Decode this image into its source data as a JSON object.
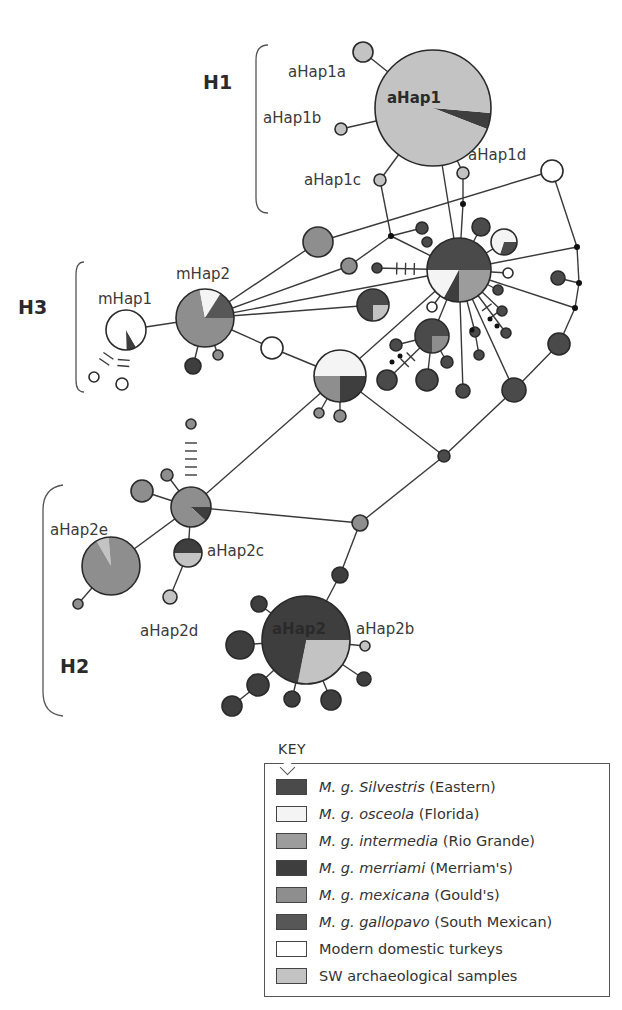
{
  "colors": {
    "silvestris": "#4a4a4a",
    "osceola": "#f4f4f4",
    "intermedia": "#9c9c9c",
    "merriami": "#3e3e3e",
    "mexicana": "#8e8e8e",
    "gallopavo": "#575757",
    "domestic": "#ffffff",
    "sw_arch": "#c3c3c3"
  },
  "groups": [
    {
      "id": "H1",
      "label": "H1",
      "x": 203,
      "y": 82
    },
    {
      "id": "H3",
      "label": "H3",
      "x": 18,
      "y": 307
    },
    {
      "id": "H2",
      "label": "H2",
      "x": 60,
      "y": 666
    }
  ],
  "haplotype_labels": [
    {
      "text": "aHap1",
      "x": 387,
      "y": 103,
      "bold": true
    },
    {
      "text": "aHap1a",
      "x": 288,
      "y": 77
    },
    {
      "text": "aHap1b",
      "x": 263,
      "y": 123
    },
    {
      "text": "aHap1c",
      "x": 304,
      "y": 185
    },
    {
      "text": "aHap1d",
      "x": 468,
      "y": 160
    },
    {
      "text": "mHap1",
      "x": 98,
      "y": 304
    },
    {
      "text": "mHap2",
      "x": 176,
      "y": 279
    },
    {
      "text": "aHap2e",
      "x": 50,
      "y": 535
    },
    {
      "text": "aHap2c",
      "x": 207,
      "y": 556
    },
    {
      "text": "aHap2d",
      "x": 140,
      "y": 636
    },
    {
      "text": "aHap2",
      "x": 272,
      "y": 634,
      "bold": true
    },
    {
      "text": "aHap2b",
      "x": 356,
      "y": 634
    }
  ],
  "key": {
    "title": "KEY",
    "items": [
      {
        "italic": "M. g. Silvestris",
        "plain": " (Eastern)",
        "color_key": "silvestris"
      },
      {
        "italic": "M. g. osceola",
        "plain": " (Florida)",
        "color_key": "osceola"
      },
      {
        "italic": "M. g. intermedia",
        "plain": " (Rio Grande)",
        "color_key": "intermedia"
      },
      {
        "italic": "M. g. merriami",
        "plain": " (Merriam's)",
        "color_key": "merriami"
      },
      {
        "italic": "M. g. mexicana",
        "plain": " (Gould's)",
        "color_key": "mexicana"
      },
      {
        "italic": "M. g. gallopavo",
        "plain": " (South Mexican)",
        "color_key": "gallopavo"
      },
      {
        "italic": "",
        "plain": "Modern domestic turkeys",
        "color_key": "domestic"
      },
      {
        "italic": "",
        "plain": "SW archaeological samples",
        "color_key": "sw_arch"
      }
    ]
  },
  "nodes": [
    {
      "id": "aHap1",
      "x": 433,
      "y": 108,
      "r": 58,
      "slices": [
        [
          "sw_arch",
          0.955
        ],
        [
          "merriami",
          0.045
        ]
      ],
      "start": 0
    },
    {
      "id": "aHap1a",
      "x": 363,
      "y": 52,
      "r": 10,
      "fill": "sw_arch"
    },
    {
      "id": "aHap1b",
      "x": 341,
      "y": 129,
      "r": 6,
      "fill": "sw_arch"
    },
    {
      "id": "aHap1c",
      "x": 380,
      "y": 180,
      "r": 6,
      "fill": "sw_arch"
    },
    {
      "id": "aHap1d",
      "x": 463,
      "y": 173,
      "r": 6,
      "fill": "sw_arch"
    },
    {
      "id": "dom1",
      "x": 552,
      "y": 171,
      "r": 11,
      "fill": "domestic"
    },
    {
      "id": "hubE",
      "x": 459,
      "y": 270,
      "r": 32,
      "slices": [
        [
          "silvestris",
          0.5
        ],
        [
          "intermedia",
          0.25
        ],
        [
          "merriami",
          0.08
        ],
        [
          "osceola",
          0.17
        ]
      ],
      "start": 0
    },
    {
      "id": "eSat1",
      "x": 481,
      "y": 227,
      "r": 9,
      "fill": "silvestris"
    },
    {
      "id": "eSat2",
      "x": 504,
      "y": 242,
      "r": 13,
      "slices": [
        [
          "osceola",
          0.6
        ],
        [
          "silvestris",
          0.3
        ],
        [
          "osceola",
          0.1
        ]
      ],
      "start": -90
    },
    {
      "id": "eSat3",
      "x": 422,
      "y": 228,
      "r": 6,
      "fill": "silvestris"
    },
    {
      "id": "eSat4",
      "x": 427,
      "y": 242,
      "r": 5,
      "fill": "silvestris"
    },
    {
      "id": "eSat5",
      "x": 377,
      "y": 268,
      "r": 5,
      "fill": "silvestris"
    },
    {
      "id": "eSat6",
      "x": 508,
      "y": 273,
      "r": 5,
      "fill": "domestic"
    },
    {
      "id": "eSat7",
      "x": 498,
      "y": 290,
      "r": 5,
      "fill": "silvestris"
    },
    {
      "id": "eSat8",
      "x": 502,
      "y": 311,
      "r": 5,
      "fill": "silvestris"
    },
    {
      "id": "eSat9",
      "x": 506,
      "y": 333,
      "r": 5,
      "fill": "silvestris"
    },
    {
      "id": "eSat10",
      "x": 432,
      "y": 307,
      "r": 5,
      "fill": "domestic"
    },
    {
      "id": "eSat11",
      "x": 475,
      "y": 332,
      "r": 5,
      "fill": "silvestris"
    },
    {
      "id": "eSat12",
      "x": 479,
      "y": 355,
      "r": 5,
      "fill": "silvestris"
    },
    {
      "id": "eSat13",
      "x": 463,
      "y": 391,
      "r": 7,
      "fill": "silvestris"
    },
    {
      "id": "eSat14",
      "x": 514,
      "y": 390,
      "r": 12,
      "fill": "silvestris"
    },
    {
      "id": "eSat15",
      "x": 558,
      "y": 278,
      "r": 7,
      "fill": "silvestris"
    },
    {
      "id": "eSat16",
      "x": 559,
      "y": 344,
      "r": 11,
      "fill": "silvestris"
    },
    {
      "id": "eSat17",
      "x": 373,
      "y": 305,
      "r": 16,
      "slices": [
        [
          "silvestris",
          0.75
        ],
        [
          "sw_arch",
          0.25
        ]
      ],
      "start": 0
    },
    {
      "id": "eSat18",
      "x": 432,
      "y": 336,
      "r": 17,
      "slices": [
        [
          "silvestris",
          0.75
        ],
        [
          "mexicana",
          0.25
        ]
      ],
      "start": 0
    },
    {
      "id": "eSat19",
      "x": 396,
      "y": 345,
      "r": 6,
      "fill": "silvestris"
    },
    {
      "id": "eSat20",
      "x": 447,
      "y": 362,
      "r": 6,
      "fill": "silvestris"
    },
    {
      "id": "eSat21",
      "x": 387,
      "y": 380,
      "r": 10,
      "fill": "silvestris"
    },
    {
      "id": "eSat22",
      "x": 427,
      "y": 380,
      "r": 11,
      "fill": "silvestris"
    },
    {
      "id": "midA",
      "x": 318,
      "y": 242,
      "r": 15,
      "fill": "mexicana"
    },
    {
      "id": "midB",
      "x": 349,
      "y": 266,
      "r": 8,
      "fill": "mexicana"
    },
    {
      "id": "mHap2",
      "x": 205,
      "y": 318,
      "r": 29,
      "slices": [
        [
          "mexicana",
          0.86
        ],
        [
          "osceola",
          0.0
        ],
        [
          "osceola",
          0.14
        ]
      ],
      "special": "mHap2"
    },
    {
      "id": "m2a",
      "x": 193,
      "y": 366,
      "r": 8,
      "fill": "merriami"
    },
    {
      "id": "m2b",
      "x": 218,
      "y": 355,
      "r": 5,
      "fill": "mexicana"
    },
    {
      "id": "mHap1",
      "x": 126,
      "y": 330,
      "r": 20,
      "slices": [
        [
          "domestic",
          0.92
        ],
        [
          "merriami",
          0.08
        ]
      ],
      "special": "mHap1"
    },
    {
      "id": "m1a",
      "x": 94,
      "y": 377,
      "r": 5,
      "fill": "domestic"
    },
    {
      "id": "m1b",
      "x": 122,
      "y": 384,
      "r": 6,
      "fill": "domestic"
    },
    {
      "id": "domMid",
      "x": 272,
      "y": 348,
      "r": 11,
      "fill": "domestic"
    },
    {
      "id": "hubMid",
      "x": 340,
      "y": 376,
      "r": 26,
      "slices": [
        [
          "osceola",
          0.5
        ],
        [
          "merriami",
          0.25
        ],
        [
          "mexicana",
          0.25
        ]
      ],
      "special": "hubMid"
    },
    {
      "id": "hm1",
      "x": 319,
      "y": 413,
      "r": 5,
      "fill": "mexicana"
    },
    {
      "id": "hm2",
      "x": 340,
      "y": 416,
      "r": 6,
      "fill": "mexicana"
    },
    {
      "id": "jn1",
      "x": 444,
      "y": 456,
      "r": 6,
      "fill": "silvestris"
    },
    {
      "id": "jn2",
      "x": 360,
      "y": 523,
      "r": 8,
      "fill": "mexicana"
    },
    {
      "id": "hubH2",
      "x": 191,
      "y": 507,
      "r": 20,
      "slices": [
        [
          "mexicana",
          0.9
        ],
        [
          "merriami",
          0.1
        ]
      ],
      "special": "hubH2"
    },
    {
      "id": "h2top",
      "x": 191,
      "y": 424,
      "r": 5,
      "fill": "mexicana"
    },
    {
      "id": "h2a",
      "x": 142,
      "y": 491,
      "r": 11,
      "fill": "mexicana"
    },
    {
      "id": "h2b",
      "x": 167,
      "y": 475,
      "r": 6,
      "fill": "mexicana"
    },
    {
      "id": "aHap2e",
      "x": 111,
      "y": 566,
      "r": 29,
      "slices": [
        [
          "mexicana",
          0.93
        ],
        [
          "sw_arch",
          0.07
        ]
      ],
      "special": "aHap2e"
    },
    {
      "id": "aHap2e_s",
      "x": 78,
      "y": 604,
      "r": 5,
      "fill": "mexicana"
    },
    {
      "id": "aHap2c",
      "x": 188,
      "y": 553,
      "r": 14,
      "slices": [
        [
          "merriami",
          0.5
        ],
        [
          "sw_arch",
          0.5
        ]
      ],
      "special": "aHap2c"
    },
    {
      "id": "aHap2d",
      "x": 170,
      "y": 597,
      "r": 7,
      "fill": "sw_arch"
    },
    {
      "id": "aHap2",
      "x": 306,
      "y": 640,
      "r": 44,
      "slices": [
        [
          "merriami",
          0.72
        ],
        [
          "sw_arch",
          0.28
        ]
      ],
      "special": "aHap2"
    },
    {
      "id": "a2up",
      "x": 340,
      "y": 575,
      "r": 8,
      "fill": "merriami"
    },
    {
      "id": "a2s1",
      "x": 259,
      "y": 604,
      "r": 8,
      "fill": "merriami"
    },
    {
      "id": "a2s2",
      "x": 240,
      "y": 645,
      "r": 14,
      "fill": "merriami"
    },
    {
      "id": "a2s3",
      "x": 258,
      "y": 685,
      "r": 11,
      "fill": "merriami"
    },
    {
      "id": "a2s4",
      "x": 232,
      "y": 706,
      "r": 10,
      "fill": "merriami"
    },
    {
      "id": "a2s5",
      "x": 292,
      "y": 699,
      "r": 8,
      "fill": "merriami"
    },
    {
      "id": "a2s6",
      "x": 331,
      "y": 700,
      "r": 10,
      "fill": "merriami"
    },
    {
      "id": "a2s7",
      "x": 364,
      "y": 679,
      "r": 7,
      "fill": "merriami"
    },
    {
      "id": "aHap2b",
      "x": 365,
      "y": 646,
      "r": 5,
      "fill": "sw_arch"
    }
  ],
  "edges": [
    [
      "aHap1",
      "aHap1a"
    ],
    [
      "aHap1",
      "aHap1b"
    ],
    [
      "aHap1",
      "aHap1c"
    ],
    [
      "aHap1",
      "aHap1d"
    ],
    [
      "aHap1c",
      "J1"
    ],
    [
      "aHap1d",
      "J2"
    ],
    [
      "aHap1",
      "hubE"
    ],
    [
      "J2",
      "hubE"
    ],
    [
      "J1",
      "hubE"
    ],
    [
      "J1",
      "midB"
    ],
    [
      "midA",
      "dom1"
    ],
    [
      "dom1",
      "J3"
    ],
    [
      "J3",
      "J4"
    ],
    [
      "J4",
      "J5"
    ],
    [
      "J5",
      "eSat16"
    ],
    [
      "hubE",
      "J3"
    ],
    [
      "hubE",
      "J5"
    ],
    [
      "J4",
      "eSat15"
    ],
    [
      "eSat16",
      "eSat14"
    ],
    [
      "eSat14",
      "jn1"
    ],
    [
      "mHap2",
      "midA"
    ],
    [
      "mHap2",
      "midB"
    ],
    [
      "mHap2",
      "hubE"
    ],
    [
      "mHap2",
      "eSat17"
    ],
    [
      "mHap2",
      "mHap1"
    ],
    [
      "mHap2",
      "domMid"
    ],
    [
      "domMid",
      "hubMid"
    ],
    [
      "mHap2",
      "m2a"
    ],
    [
      "mHap2",
      "m2b"
    ],
    [
      "hubMid",
      "hubE"
    ],
    [
      "hubMid",
      "hm1"
    ],
    [
      "hubMid",
      "hm2"
    ],
    [
      "hubMid",
      "jn1"
    ],
    [
      "hubMid",
      "hubH2"
    ],
    [
      "jn1",
      "jn2"
    ],
    [
      "jn2",
      "hubH2"
    ],
    [
      "jn2",
      "a2up"
    ],
    [
      "a2up",
      "aHap2"
    ],
    [
      "hubH2",
      "h2a"
    ],
    [
      "hubH2",
      "h2b"
    ],
    [
      "hubH2",
      "aHap2e"
    ],
    [
      "hubH2",
      "aHap2c"
    ],
    [
      "aHap2c",
      "aHap2d"
    ],
    [
      "aHap2e",
      "aHap2e_s"
    ],
    [
      "aHap2",
      "a2s1"
    ],
    [
      "aHap2",
      "a2s2"
    ],
    [
      "aHap2",
      "a2s3"
    ],
    [
      "a2s3",
      "a2s4"
    ],
    [
      "aHap2",
      "a2s5"
    ],
    [
      "aHap2",
      "a2s6"
    ],
    [
      "aHap2",
      "a2s7"
    ],
    [
      "aHap2",
      "aHap2b"
    ],
    [
      "hubE",
      "eSat1"
    ],
    [
      "hubE",
      "eSat2"
    ],
    [
      "hubE",
      "eSat6"
    ],
    [
      "hubE",
      "eSat7"
    ],
    [
      "hubE",
      "eSat8"
    ],
    [
      "hubE",
      "eSat9"
    ],
    [
      "hubE",
      "eSat10"
    ],
    [
      "hubE",
      "eSat11"
    ],
    [
      "eSat11",
      "eSat12"
    ],
    [
      "hubE",
      "eSat13"
    ],
    [
      "hubE",
      "eSat14"
    ],
    [
      "hubE",
      "eSat18"
    ],
    [
      "eSat18",
      "eSat19"
    ],
    [
      "eSat18",
      "eSat20"
    ],
    [
      "eSat18",
      "eSat21"
    ],
    [
      "eSat18",
      "eSat22"
    ],
    [
      "J1",
      "eSat3"
    ],
    [
      "hubE",
      "eSat5"
    ]
  ],
  "junctions": [
    {
      "id": "J1",
      "x": 391,
      "y": 236
    },
    {
      "id": "J2",
      "x": 463,
      "y": 204
    },
    {
      "id": "J3",
      "x": 577,
      "y": 247
    },
    {
      "id": "J4",
      "x": 579,
      "y": 283
    },
    {
      "id": "J5",
      "x": 575,
      "y": 308
    }
  ],
  "mutation_ticks": [
    {
      "from": "eSat5",
      "to": "hubE",
      "count": 3
    },
    {
      "from": "h2top",
      "to": "hubH2",
      "count": 5
    },
    {
      "from": "m1b",
      "to": "mHap1",
      "count": 2
    },
    {
      "from": "m1a",
      "to": "mHap1",
      "count": 2
    },
    {
      "from": "eSat21",
      "to": "eSat18",
      "count": 2
    },
    {
      "from": "eSat9",
      "to": "hubE",
      "count": 2
    }
  ]
}
